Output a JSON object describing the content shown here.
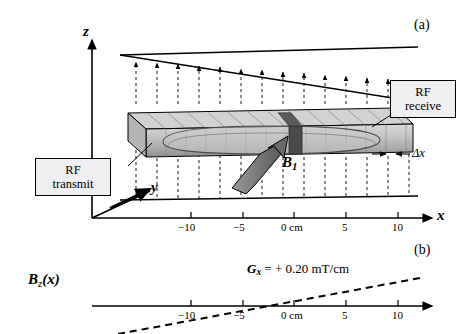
{
  "figure": {
    "panel_a_label": "(a)",
    "panel_b_label": "(b)"
  },
  "panel_a": {
    "axis_z_label": "z",
    "axis_x_label": "x",
    "axis_y_label": "y",
    "field_label_B": "B",
    "field_label_B_sub": "1",
    "slice_thickness_label": "Δx",
    "callout_rf_transmit": "RF\ntransmit",
    "callout_rf_receive": "RF\nreceive",
    "x_ticks": [
      {
        "label": "−10",
        "x": 186
      },
      {
        "label": "−5",
        "x": 241
      },
      {
        "label": "0 cm",
        "x": 290
      },
      {
        "label": "5",
        "x": 344
      },
      {
        "label": "10",
        "x": 395
      }
    ]
  },
  "panel_b": {
    "y_axis_label_main": "B",
    "y_axis_label_sub": "z",
    "y_axis_label_arg": "(x)",
    "gradient_label": "G",
    "gradient_label_sub": "x",
    "gradient_value": " = + 0.20 mT/cm",
    "x_ticks": [
      {
        "label": "−10",
        "x": 186
      },
      {
        "label": "−5",
        "x": 241
      },
      {
        "label": "0 cm",
        "x": 290
      },
      {
        "label": "5",
        "x": 344
      },
      {
        "label": "10",
        "x": 395
      }
    ]
  },
  "colors": {
    "line": "#000000",
    "phantom_body": "#bdbdbd",
    "phantom_light": "#dcdcdc",
    "phantom_dark": "#6e6e6e",
    "slice_dark": "#4a4a4a",
    "callout_fill": "#efeff1"
  }
}
